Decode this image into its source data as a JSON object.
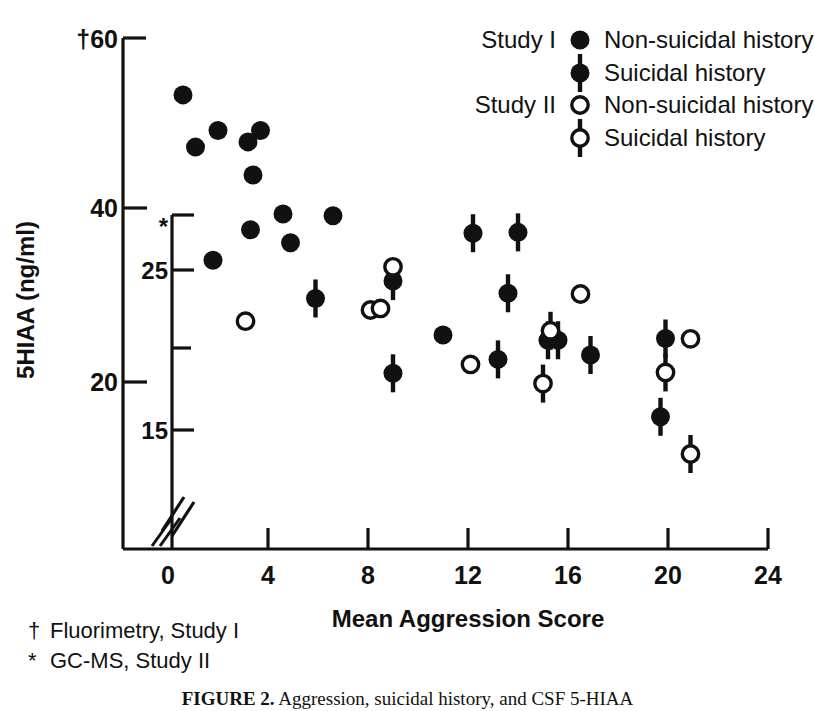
{
  "figure": {
    "caption_label": "FIGURE 2.",
    "caption_text": "Aggression, suicidal history, and CSF 5-HIAA"
  },
  "axes": {
    "y_label": "5HIAA (ng/ml)",
    "x_label": "Mean Aggression Score",
    "y_outer_marker": "†",
    "y_inner_marker": "*",
    "y_outer_ticks": [
      "60",
      "40",
      "20"
    ],
    "y_inner_ticks": [
      "25",
      "15"
    ],
    "x_ticks": [
      "0",
      "4",
      "8",
      "12",
      "16",
      "20",
      "24"
    ],
    "axis_break_glyph": "//"
  },
  "legend": {
    "rows": [
      {
        "study": "Study  I",
        "marker": "filled-circle",
        "label": "Non-suicidal history"
      },
      {
        "study": "",
        "marker": "filled-circle-bar",
        "label": "Suicidal history"
      },
      {
        "study": "Study II",
        "marker": "open-circle",
        "label": "Non-suicidal history"
      },
      {
        "study": "",
        "marker": "open-circle-bar",
        "label": "Suicidal history"
      }
    ]
  },
  "footnotes": [
    {
      "symbol": "†",
      "text": "Fluorimetry, Study I"
    },
    {
      "symbol": "*",
      "text": "GC-MS, Study II"
    }
  ],
  "colors": {
    "ink": "#111111",
    "background": "#ffffff",
    "marker_fill": "#1a1a1a",
    "marker_open": "#ffffff"
  },
  "chart_data": {
    "type": "scatter",
    "title": "Aggression, suicidal history, and CSF 5-HIAA",
    "xlabel": "Mean Aggression Score",
    "ylabel": "5HIAA (ng/ml)",
    "grid": false,
    "legend_position": "top-right",
    "xlim": [
      0,
      24
    ],
    "xticks": [
      0,
      4,
      8,
      12,
      16,
      20,
      24
    ],
    "axis_note": "Broken axis near origin; dual y-scales: outer = Fluorimetry (Study I), inner = GC-MS (Study II)",
    "y_axis_outer": {
      "name": "Fluorimetry, Study I",
      "symbol": "†",
      "ticks": [
        20,
        40,
        60
      ],
      "lim": [
        10.5,
        60
      ]
    },
    "y_axis_inner": {
      "name": "GC-MS, Study II",
      "symbol": "*",
      "ticks": [
        15,
        20,
        25
      ],
      "lim": [
        9.0,
        27.5
      ]
    },
    "series": [
      {
        "name": "Study I — Non-suicidal history",
        "marker": "filled-circle",
        "y_scale": "outer",
        "points": [
          {
            "x": 0.6,
            "y": 53.0
          },
          {
            "x": 1.1,
            "y": 47.0
          },
          {
            "x": 2.0,
            "y": 48.9
          },
          {
            "x": 3.2,
            "y": 47.6
          },
          {
            "x": 3.7,
            "y": 48.9
          },
          {
            "x": 3.4,
            "y": 43.8
          },
          {
            "x": 3.3,
            "y": 37.5
          },
          {
            "x": 4.6,
            "y": 39.3
          },
          {
            "x": 6.6,
            "y": 39.1
          },
          {
            "x": 1.8,
            "y": 34.0
          },
          {
            "x": 4.9,
            "y": 36.0
          },
          {
            "x": 11.0,
            "y": 25.4
          }
        ]
      },
      {
        "name": "Study I — Suicidal history",
        "marker": "filled-circle-bar",
        "y_scale": "outer",
        "points": [
          {
            "x": 5.9,
            "y": 29.6
          },
          {
            "x": 9.0,
            "y": 31.6
          },
          {
            "x": 9.0,
            "y": 21.0
          },
          {
            "x": 12.2,
            "y": 37.1
          },
          {
            "x": 13.2,
            "y": 22.6
          },
          {
            "x": 13.6,
            "y": 30.2
          },
          {
            "x": 14.0,
            "y": 37.2
          },
          {
            "x": 15.2,
            "y": 24.8
          },
          {
            "x": 15.6,
            "y": 24.8
          },
          {
            "x": 16.9,
            "y": 23.1
          },
          {
            "x": 19.7,
            "y": 16.0
          },
          {
            "x": 19.9,
            "y": 25.0
          }
        ]
      },
      {
        "name": "Study II — Non-suicidal history",
        "marker": "open-circle",
        "y_scale": "inner",
        "points": [
          {
            "x": 3.1,
            "y": 21.8
          },
          {
            "x": 8.1,
            "y": 22.5
          },
          {
            "x": 8.5,
            "y": 22.6
          },
          {
            "x": 9.0,
            "y": 25.2
          },
          {
            "x": 12.1,
            "y": 19.1
          },
          {
            "x": 16.5,
            "y": 23.5
          },
          {
            "x": 20.9,
            "y": 20.7
          }
        ]
      },
      {
        "name": "Study II — Suicidal history",
        "marker": "open-circle-bar",
        "y_scale": "inner",
        "points": [
          {
            "x": 15.0,
            "y": 17.9
          },
          {
            "x": 15.3,
            "y": 21.2
          },
          {
            "x": 19.9,
            "y": 18.6
          },
          {
            "x": 20.9,
            "y": 13.5
          }
        ]
      }
    ]
  }
}
